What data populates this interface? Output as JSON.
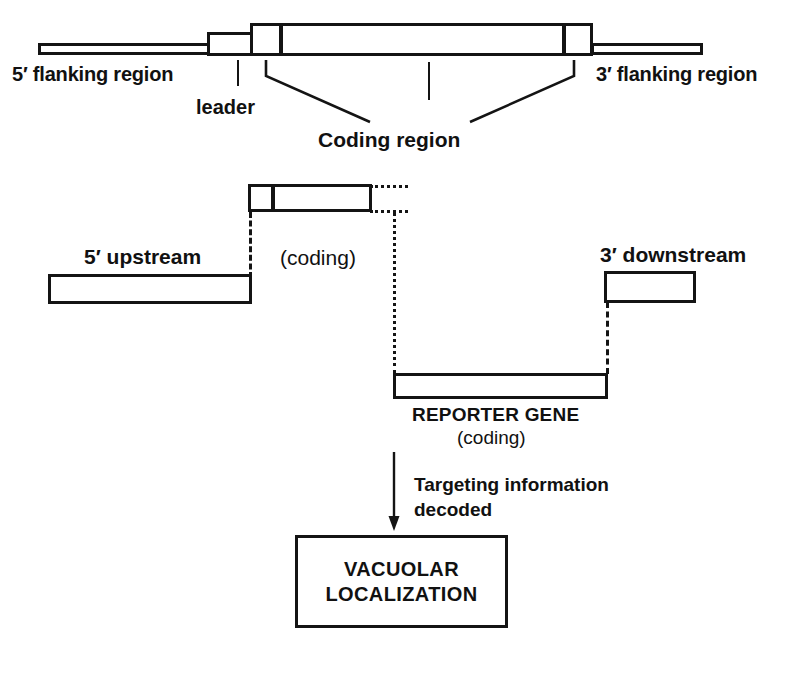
{
  "figure": {
    "type": "diagram",
    "panels": [
      {
        "id": "gene-map",
        "caption_parts": [
          "5′ flanking region",
          "leader",
          "Coding region",
          "3′ flanking region"
        ]
      },
      {
        "id": "construct",
        "caption_parts": [
          "5′ upstream",
          "(coding)",
          "3′ downstream",
          "REPORTER GENE",
          "(coding)"
        ]
      },
      {
        "id": "outcome",
        "caption_parts": [
          "Targeting information",
          "decoded",
          "VACUOLAR",
          "LOCALIZATION"
        ]
      }
    ]
  },
  "top_panel": {
    "label_five_prime_flanking": "5′ flanking region",
    "label_three_prime_flanking": "3′ flanking region",
    "label_leader": "leader",
    "label_coding_region": "Coding region"
  },
  "middle_panel": {
    "label_coding_construct": "(coding)",
    "label_five_prime_upstream": "5′ upstream",
    "label_three_prime_downstream": "3′ downstream"
  },
  "reporter_panel": {
    "label_reporter_gene": "REPORTER GENE",
    "label_reporter_coding": "(coding)"
  },
  "outcome_panel": {
    "label_targeting_line1": "Targeting information",
    "label_targeting_line2": "decoded",
    "label_vacuolar_line1": "VACUOLAR",
    "label_vacuolar_line2": "LOCALIZATION"
  },
  "style": {
    "stroke_color": "#141414",
    "fill_color": "#ffffff",
    "background": "#ffffff"
  }
}
